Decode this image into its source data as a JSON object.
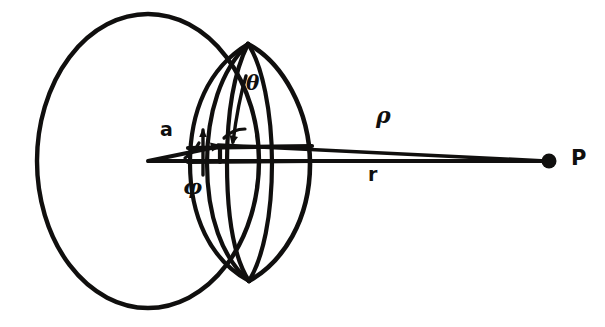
{
  "figure": {
    "kind": "geometry-diagram",
    "background_color": "#ffffff",
    "ink_color": "#100f0e",
    "width": 605,
    "height": 327
  },
  "labels": {
    "vector_a": "a",
    "angle_phi": "φ",
    "angle_theta": "θ",
    "distance_rho": "ρ",
    "vector_r": "r",
    "point_P": "P"
  },
  "geometry": {
    "sphere": {
      "center_x": 148,
      "center_y": 161,
      "radius_x": 111,
      "radius_y": 147,
      "stroke_width": 4.4
    },
    "origin": {
      "x": 148,
      "y": 161
    },
    "source_point": {
      "x": 219,
      "y": 146
    },
    "field_point_P": {
      "x": 549,
      "y": 161,
      "dot_radius": 7.5
    },
    "pole_top": {
      "x": 248,
      "y": 44
    },
    "pole_bottom": {
      "x": 249,
      "y": 281
    },
    "meridians": [
      {
        "name": "meridian-outer-left",
        "bulge_x": 191
      },
      {
        "name": "meridian-inner-left",
        "bulge_x": 208
      },
      {
        "name": "meridian-center",
        "bulge_x": 228
      },
      {
        "name": "meridian-inner-right",
        "bulge_x": 272
      },
      {
        "name": "meridian-outer-right",
        "bulge_x": 310
      }
    ],
    "parallels": [
      {
        "name": "parallel-upper",
        "y": 147
      },
      {
        "name": "parallel-equator",
        "y": 161
      }
    ]
  }
}
